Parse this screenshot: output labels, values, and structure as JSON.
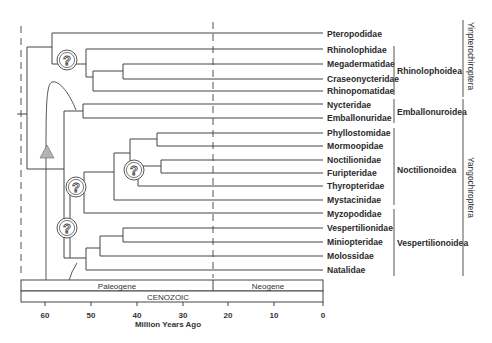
{
  "colors": {
    "line": "#444444",
    "text": "#2a2a2a",
    "triangle": "#b0b0b0",
    "background": "#ffffff"
  },
  "taxa": [
    {
      "name": "Pteropodidae",
      "y": 34
    },
    {
      "name": "Rhinolophidae",
      "y": 50
    },
    {
      "name": "Megadermatidae",
      "y": 64
    },
    {
      "name": "Craseonycteridae",
      "y": 79
    },
    {
      "name": "Rhinopomatidae",
      "y": 91
    },
    {
      "name": "Nycteridae",
      "y": 105
    },
    {
      "name": "Emballonuridae",
      "y": 118
    },
    {
      "name": "Phyllostomidae",
      "y": 133
    },
    {
      "name": "Mormoopidae",
      "y": 146
    },
    {
      "name": "Noctilionidae",
      "y": 160
    },
    {
      "name": "Furipteridae",
      "y": 173
    },
    {
      "name": "Thyropteridae",
      "y": 186
    },
    {
      "name": "Mystacinidae",
      "y": 200
    },
    {
      "name": "Myzopodidae",
      "y": 214
    },
    {
      "name": "Vespertilionidae",
      "y": 228
    },
    {
      "name": "Miniopteridae",
      "y": 242
    },
    {
      "name": "Molossidae",
      "y": 256
    },
    {
      "name": "Natalidae",
      "y": 270
    }
  ],
  "superfamilies": [
    {
      "name": "Rhinolophoidea",
      "y1": 46,
      "y2": 95
    },
    {
      "name": "Emballonuroidea",
      "y1": 99,
      "y2": 123
    },
    {
      "name": "Noctilionoidea",
      "y1": 128,
      "y2": 205
    },
    {
      "name": "Vespertilionoidea",
      "y1": 209,
      "y2": 276
    }
  ],
  "suborders": [
    {
      "name": "Yinpterochiroptera",
      "y1": 20,
      "y2": 97
    },
    {
      "name": "Yangochiroptera",
      "y1": 99,
      "y2": 276
    }
  ],
  "timescale": {
    "periods": [
      {
        "name": "Paleogene",
        "from_ma": 65,
        "to_ma": 23
      },
      {
        "name": "Neogene",
        "from_ma": 23,
        "to_ma": 0
      }
    ],
    "era": "CENOZOIC",
    "ticks": [
      "60",
      "50",
      "40",
      "30",
      "20",
      "10",
      "0"
    ],
    "axis_label": "Million Years Ago"
  },
  "uncertain_node_symbol": "?"
}
